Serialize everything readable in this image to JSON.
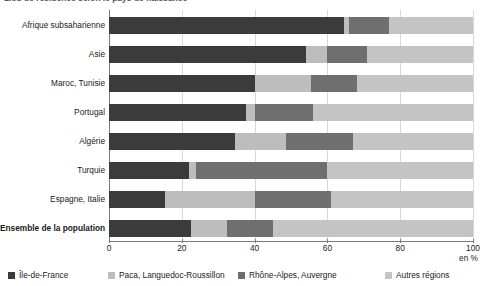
{
  "title_sliver": "Lieu de résidence selon le pays de naissance",
  "axis": {
    "unit_label": "en %",
    "xticks": [
      0,
      20,
      40,
      60,
      80,
      100
    ],
    "xmin": 0,
    "xmax": 100
  },
  "legend": {
    "position": "bottom",
    "items": [
      {
        "label": "Île-de-France",
        "color": "#3b3b3b",
        "swatch": "legend-swatch-ile-de-france"
      },
      {
        "label": "Paca, Languedoc-Roussillon",
        "color": "#bdbdbd",
        "swatch": "legend-swatch-paca"
      },
      {
        "label": "Rhône-Alpes, Auvergne",
        "color": "#6f6f6f",
        "swatch": "legend-swatch-rhone-alpes"
      },
      {
        "label": "Autres régions",
        "color": "#c4c4c4",
        "swatch": "legend-swatch-autres"
      }
    ]
  },
  "colors": {
    "ile_de_france": "#3b3b3b",
    "paca": "#bdbdbd",
    "rhone_alpes": "#6f6f6f",
    "autres": "#c4c4c4",
    "gridline": "#d8d8d8",
    "axis": "#7a7a7a"
  },
  "chart_data": {
    "type": "bar",
    "orientation": "horizontal",
    "stacked": true,
    "stack_total": 100,
    "title": "Lieu de résidence selon le pays de naissance",
    "xlabel": "en %",
    "ylabel": "",
    "xlim": [
      0,
      100
    ],
    "grid": true,
    "legend_position": "bottom",
    "categories": [
      "Afrique subsaharienne",
      "Asie",
      "Maroc, Tunisie",
      "Portugal",
      "Algérie",
      "Turquie",
      "Espagne, Italie",
      "Ensemble de la population"
    ],
    "bold_categories": [
      "Ensemble de la population"
    ],
    "series": [
      {
        "name": "Île-de-France",
        "values": [
          64.5,
          54.0,
          40.0,
          37.5,
          34.5,
          22.0,
          15.5,
          22.5
        ]
      },
      {
        "name": "Paca, Languedoc-Roussillon",
        "values": [
          1.5,
          6.0,
          15.5,
          2.5,
          14.0,
          2.0,
          24.5,
          10.0
        ]
      },
      {
        "name": "Rhône-Alpes, Auvergne",
        "values": [
          11.0,
          11.0,
          12.5,
          16.0,
          18.5,
          36.0,
          21.0,
          12.5
        ]
      },
      {
        "name": "Autres régions",
        "values": [
          23.0,
          29.0,
          32.0,
          44.0,
          33.0,
          40.0,
          39.0,
          55.0
        ]
      }
    ]
  }
}
